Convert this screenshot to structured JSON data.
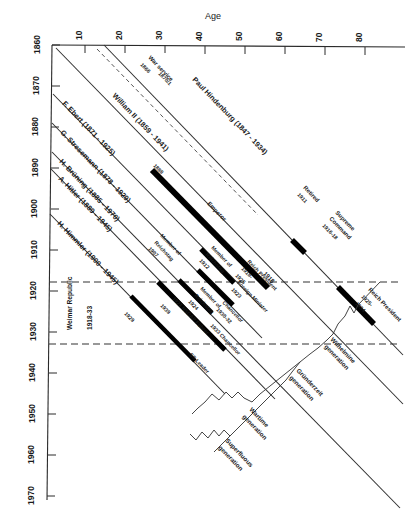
{
  "figure": {
    "orientation": "rotated-90",
    "axes": {
      "age_axis": {
        "title": "Age",
        "ticks": [
          "10",
          "20",
          "30",
          "40",
          "50",
          "60",
          "70",
          "80"
        ],
        "values": [
          10,
          20,
          30,
          40,
          50,
          60,
          70,
          80
        ],
        "range": [
          0,
          90
        ]
      },
      "year_axis": {
        "title": "",
        "ticks": [
          "1860",
          "1870",
          "1880",
          "1890",
          "1900",
          "1910",
          "1920",
          "1930",
          "1940",
          "1950",
          "1960",
          "1970"
        ],
        "values": [
          1860,
          1870,
          1880,
          1890,
          1900,
          1910,
          1920,
          1930,
          1940,
          1950,
          1960,
          1970
        ],
        "range": [
          1860,
          1970
        ]
      }
    },
    "era_band": {
      "label": "Weimar Republic",
      "years_label": "1918-33",
      "start": 1918,
      "end": 1933
    },
    "persons": [
      {
        "name": "Paul Hindenburg (1847 - 1934)",
        "birth": 1847,
        "death": 1934
      },
      {
        "name": "William II (1859 - 1941)",
        "birth": 1859,
        "death": 1941
      },
      {
        "name": "F. Ebert (1871 - 1925)",
        "birth": 1871,
        "death": 1925
      },
      {
        "name": "G. Stresemann (1878 - 1929)",
        "birth": 1878,
        "death": 1929
      },
      {
        "name": "H. Brüning (1885 - 1970)",
        "birth": 1885,
        "death": 1970
      },
      {
        "name": "A. Hitler (1889 - 1945)",
        "birth": 1889,
        "death": 1945
      },
      {
        "name": "H. Himmler (1900 - 1945)",
        "birth": 1900,
        "death": 1945
      }
    ],
    "events": [
      {
        "text": "War service",
        "sub": "1866",
        "sub2": "1870/1"
      },
      {
        "text": "Retired",
        "sub": "1911"
      },
      {
        "text": "Supreme",
        "sub": "Command",
        "sub2": "1916-18"
      },
      {
        "text": "Reich President",
        "sub": "1925-",
        "sub2": "1934"
      },
      {
        "text": "Emperor",
        "sub": "1888"
      },
      {
        "text": "1918",
        "sub": ""
      },
      {
        "text": "Member of",
        "sub": "Reichstag",
        "sub2": "1912"
      },
      {
        "text": "Reich President",
        "sub": "1918-",
        "sub2": "1925"
      },
      {
        "text": "Member of",
        "sub": "Reichstag",
        "sub2": "1907"
      },
      {
        "text": "Foreign Minister",
        "sub": "1923"
      },
      {
        "text": "Member of",
        "sub": "Reichstag",
        "sub2": "1924"
      },
      {
        "text": "Chancellor",
        "sub": "1930-32"
      },
      {
        "text": "1921 NSDAP Führer",
        "sub": ""
      },
      {
        "text": "1933 Chancellor",
        "sub": "1933"
      },
      {
        "text": "SS Leader",
        "sub": "1929"
      },
      {
        "text": "1939",
        "sub": ""
      }
    ],
    "generations": [
      {
        "label_line1": "Wilhelmine",
        "label_line2": "generation"
      },
      {
        "label_line1": "Gründerzeit",
        "label_line2": "generation"
      },
      {
        "label_line1": "Wartime",
        "label_line2": "generation"
      },
      {
        "label_line1": "Superfluous",
        "label_line2": "generation"
      }
    ],
    "colors": {
      "ink": "#1a1a1a",
      "axis": "#2a2a2a",
      "bar": "#000000",
      "background": "#ffffff"
    }
  }
}
